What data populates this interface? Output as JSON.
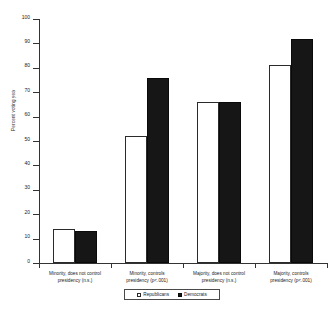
{
  "chart_data": {
    "type": "bar",
    "title": "",
    "xlabel": "",
    "ylabel": "Percent voting yea",
    "ylim": [
      0,
      100
    ],
    "yticks": [
      0,
      10,
      20,
      30,
      40,
      50,
      60,
      70,
      80,
      90,
      100
    ],
    "grid": false,
    "legend_position": "bottom",
    "categories": [
      "Minority, does not control presidency (n.s.)",
      "Minority, controls presidency (p<.001)",
      "Majority, does not control presidency (n.s.)",
      "Majority, controls presidency (p<.001)"
    ],
    "category_lines": [
      [
        "Minority, does not control",
        "presidency (n.s.)"
      ],
      [
        "Minority, controls",
        "presidency (p<.001)"
      ],
      [
        "Majority, does not control",
        "presidency (n.s.)"
      ],
      [
        "Majority, controls",
        "presidency (p<.001)"
      ]
    ],
    "series": [
      {
        "name": "Republicans",
        "color": "#ffffff",
        "edge": "#2b2b2b",
        "values": [
          14,
          52,
          66,
          81
        ]
      },
      {
        "name": "Democrats",
        "color": "#161616",
        "edge": "#0a0a0a",
        "values": [
          13,
          76,
          66,
          92
        ]
      }
    ]
  },
  "axis": {
    "y_title": "Percent voting yea",
    "y_tick_labels": [
      "100",
      "90",
      "80",
      "70",
      "60",
      "50",
      "40",
      "30",
      "20",
      "10",
      "0"
    ]
  },
  "legend": {
    "entries": [
      {
        "label": "Republicans",
        "swatch": "open-square"
      },
      {
        "label": "Democrats",
        "swatch": "filled-square"
      }
    ]
  }
}
